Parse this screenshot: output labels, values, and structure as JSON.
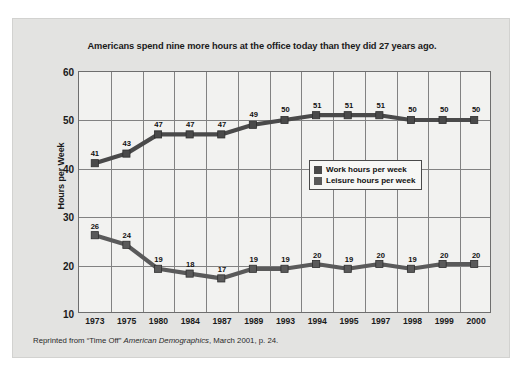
{
  "panel": {
    "background_color": "#e3e3e1"
  },
  "chart": {
    "title": "Americans spend nine more hours at the office today than they did 27 years ago.",
    "y_axis_title": "Hours per Week",
    "plot_background_color": "#f2f2f0",
    "gridline_color": "#828282",
    "series_color": "#4a4a4a",
    "marker_color": "#5a5a5a"
  },
  "legend": {
    "position": "inside-right-middle",
    "entries": [
      {
        "label": "Work hours per week",
        "color": "#4a4a4a"
      },
      {
        "label": "Leisure hours per week",
        "color": "#5a5a5a"
      }
    ]
  },
  "source_note": {
    "prefix": "Reprinted from “Time Off” ",
    "italic": "American Demographics",
    "suffix": ", March 2001, p. 24."
  },
  "chart_data": {
    "type": "line",
    "title": "Americans spend nine more hours at the office today than they did 27 years ago.",
    "xlabel": "",
    "ylabel": "Hours per Week",
    "ylim": [
      10,
      60
    ],
    "yticks": [
      10,
      20,
      30,
      40,
      50,
      60
    ],
    "grid": true,
    "legend_position": "inside-right-middle",
    "categories": [
      "1973",
      "1975",
      "1980",
      "1984",
      "1987",
      "1989",
      "1993",
      "1994",
      "1995",
      "1997",
      "1998",
      "1999",
      "2000"
    ],
    "series": [
      {
        "name": "Work hours per week",
        "color": "#4a4a4a",
        "values": [
          41,
          43,
          47,
          47,
          47,
          49,
          50,
          51,
          51,
          51,
          50,
          50,
          50
        ]
      },
      {
        "name": "Leisure hours per week",
        "color": "#5a5a5a",
        "values": [
          26,
          24,
          19,
          18,
          17,
          19,
          19,
          20,
          19,
          20,
          19,
          20,
          20
        ]
      }
    ],
    "data_labels": true
  }
}
